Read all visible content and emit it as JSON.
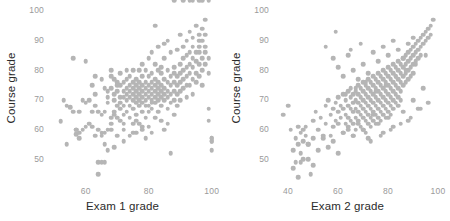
{
  "figure": {
    "background_color": "#ffffff",
    "point_color": "#b5b5b5",
    "tick_color": "#9a9a9a",
    "label_color": "#2b2b2b"
  },
  "chart_data": [
    {
      "type": "scatter",
      "title": "",
      "xlabel": "Exam 1 grade",
      "ylabel": "Course grade",
      "xlim": [
        48,
        102
      ],
      "ylim": [
        43,
        101
      ],
      "xticks": [
        60,
        80,
        100
      ],
      "yticks": [
        50,
        60,
        70,
        80,
        90,
        100
      ],
      "grid": false,
      "legend": "none",
      "x": [
        52,
        53,
        54,
        55,
        56,
        56,
        57,
        57,
        58,
        58,
        58,
        59,
        59,
        60,
        60,
        61,
        61,
        62,
        62,
        62,
        63,
        63,
        63,
        64,
        64,
        64,
        65,
        65,
        65,
        65,
        66,
        66,
        66,
        66,
        67,
        67,
        67,
        67,
        68,
        68,
        68,
        68,
        68,
        69,
        69,
        69,
        69,
        70,
        70,
        70,
        70,
        70,
        71,
        71,
        71,
        71,
        71,
        72,
        72,
        72,
        72,
        72,
        72,
        73,
        73,
        73,
        73,
        73,
        73,
        74,
        74,
        74,
        74,
        74,
        74,
        75,
        75,
        75,
        75,
        75,
        75,
        75,
        76,
        76,
        76,
        76,
        76,
        76,
        76,
        77,
        77,
        77,
        77,
        77,
        77,
        77,
        78,
        78,
        78,
        78,
        78,
        78,
        78,
        78,
        79,
        79,
        79,
        79,
        79,
        79,
        79,
        79,
        80,
        80,
        80,
        80,
        80,
        80,
        80,
        80,
        81,
        81,
        81,
        81,
        81,
        81,
        81,
        81,
        82,
        82,
        82,
        82,
        82,
        82,
        82,
        83,
        83,
        83,
        83,
        83,
        83,
        83,
        84,
        84,
        84,
        84,
        84,
        84,
        85,
        85,
        85,
        85,
        85,
        85,
        86,
        86,
        86,
        86,
        86,
        86,
        87,
        87,
        87,
        87,
        87,
        88,
        88,
        88,
        88,
        88,
        88,
        89,
        89,
        89,
        89,
        89,
        90,
        90,
        90,
        90,
        90,
        90,
        91,
        91,
        91,
        91,
        91,
        92,
        92,
        92,
        92,
        92,
        92,
        93,
        93,
        93,
        93,
        93,
        94,
        94,
        94,
        94,
        94,
        94,
        95,
        95,
        95,
        95,
        95,
        96,
        96,
        96,
        96,
        96,
        96,
        97,
        97,
        97,
        97,
        97,
        98,
        98,
        98,
        98,
        98,
        99,
        99,
        99,
        99,
        100,
        100,
        100,
        100,
        100,
        54,
        57,
        60,
        63,
        66,
        69,
        72,
        75,
        78,
        81,
        84,
        87,
        65,
        68,
        71,
        74,
        86,
        69,
        72,
        76,
        64,
        67,
        70,
        82,
        85,
        88,
        91,
        94,
        97,
        99,
        93,
        96
      ],
      "y": [
        62.8,
        70,
        68,
        67.5,
        66,
        84,
        60,
        58.5,
        59,
        57,
        66,
        60,
        70,
        83,
        69,
        70,
        62,
        66,
        75,
        61,
        68,
        78,
        72,
        49,
        45,
        60,
        65,
        49,
        59,
        77,
        66,
        74,
        59,
        55,
        73,
        69,
        53,
        71,
        80,
        74,
        64,
        60,
        78,
        72,
        66,
        70,
        54,
        76,
        73,
        68,
        64,
        58,
        71,
        75,
        69,
        67,
        79,
        73,
        71,
        76,
        68,
        65,
        62,
        74,
        70,
        77,
        72,
        66,
        80,
        75,
        71,
        73,
        68,
        64,
        78,
        76,
        72,
        70,
        74,
        67,
        80,
        62,
        73,
        71,
        75,
        69,
        77,
        65,
        59,
        76,
        72,
        74,
        70,
        68,
        80,
        62,
        75,
        73,
        71,
        78,
        69,
        66,
        82,
        60,
        74,
        72,
        76,
        70,
        68,
        80,
        64,
        57,
        75,
        73,
        71,
        78,
        68,
        66,
        84,
        61,
        76,
        74,
        72,
        70,
        79,
        67,
        86,
        59,
        75,
        73,
        71,
        77,
        69,
        82,
        64,
        76,
        74,
        72,
        70,
        80,
        66,
        88,
        75,
        73,
        71,
        79,
        68,
        63,
        77,
        74,
        72,
        70,
        84,
        60,
        76,
        73,
        71,
        80,
        67,
        90,
        78,
        75,
        72,
        69,
        86,
        79,
        76,
        73,
        70,
        65,
        81,
        78,
        75,
        72,
        68,
        87,
        82,
        79,
        76,
        73,
        70,
        92,
        84,
        80,
        77,
        74,
        88,
        85,
        81,
        78,
        75,
        71,
        90,
        86,
        82,
        79,
        75,
        93,
        88,
        84,
        81,
        77,
        72,
        91,
        86,
        83,
        79,
        76,
        95,
        90,
        86,
        82,
        78,
        92,
        88,
        84,
        80,
        75,
        94,
        90,
        86,
        82,
        97,
        92,
        88,
        84,
        79,
        63,
        67,
        56,
        57,
        56,
        53,
        57,
        55,
        60,
        61,
        58,
        49,
        77,
        56,
        59,
        61,
        69,
        81,
        52,
        58,
        62,
        63,
        58,
        62,
        65,
        60,
        63,
        66,
        60,
        75,
        95,
        89
      ],
      "n_points": 300
    },
    {
      "type": "scatter",
      "title": "",
      "xlabel": "Exam 2 grade",
      "ylabel": "Course grade",
      "xlim": [
        34,
        102
      ],
      "ylim": [
        43,
        101
      ],
      "xticks": [
        40,
        60,
        80,
        100
      ],
      "yticks": [
        50,
        60,
        70,
        80,
        90,
        100
      ],
      "grid": false,
      "legend": "none",
      "x": [
        38,
        40,
        41,
        42,
        43,
        43,
        44,
        44,
        45,
        45,
        45,
        46,
        46,
        47,
        47,
        48,
        48,
        49,
        50,
        50,
        51,
        52,
        53,
        54,
        55,
        55,
        56,
        57,
        57,
        58,
        58,
        59,
        59,
        60,
        60,
        60,
        61,
        61,
        62,
        62,
        62,
        63,
        63,
        63,
        64,
        64,
        64,
        64,
        65,
        65,
        65,
        65,
        66,
        66,
        66,
        66,
        66,
        67,
        67,
        67,
        67,
        67,
        68,
        68,
        68,
        68,
        68,
        69,
        69,
        69,
        69,
        69,
        70,
        70,
        70,
        70,
        70,
        70,
        71,
        71,
        71,
        71,
        71,
        71,
        72,
        72,
        72,
        72,
        72,
        72,
        73,
        73,
        73,
        73,
        73,
        73,
        74,
        74,
        74,
        74,
        74,
        74,
        75,
        75,
        75,
        75,
        75,
        75,
        76,
        76,
        76,
        76,
        76,
        76,
        77,
        77,
        77,
        77,
        77,
        77,
        78,
        78,
        78,
        78,
        78,
        78,
        79,
        79,
        79,
        79,
        79,
        79,
        80,
        80,
        80,
        80,
        80,
        80,
        81,
        81,
        81,
        81,
        81,
        81,
        82,
        82,
        82,
        82,
        82,
        82,
        83,
        83,
        83,
        83,
        83,
        84,
        84,
        84,
        84,
        84,
        85,
        85,
        85,
        85,
        85,
        86,
        86,
        86,
        86,
        87,
        87,
        87,
        87,
        88,
        88,
        88,
        88,
        89,
        89,
        89,
        89,
        90,
        90,
        90,
        90,
        91,
        91,
        91,
        92,
        92,
        92,
        93,
        93,
        93,
        94,
        94,
        95,
        95,
        96,
        96,
        97,
        97,
        98,
        42,
        44,
        46,
        48,
        50,
        52,
        54,
        56,
        58,
        60,
        62,
        64,
        66,
        68,
        70,
        72,
        74,
        76,
        78,
        80,
        82,
        84,
        86,
        88,
        90,
        92,
        94,
        96,
        58,
        60,
        62,
        64,
        66,
        68,
        70,
        72,
        74,
        76,
        78,
        80,
        82,
        84,
        86,
        88,
        90,
        55,
        59,
        63,
        67,
        71,
        75,
        79,
        83,
        87,
        91,
        95,
        65,
        69,
        73,
        77,
        81,
        85,
        89,
        93
      ],
      "y": [
        65,
        68,
        60,
        53,
        57,
        49,
        61,
        55,
        59,
        52,
        49,
        60,
        56,
        58,
        61,
        55,
        50,
        45,
        57,
        63,
        66,
        60,
        64,
        57,
        68,
        62,
        70,
        58,
        65,
        67,
        61,
        69,
        63,
        71,
        66,
        62,
        68,
        64,
        72,
        67,
        59,
        70,
        65,
        62,
        73,
        68,
        64,
        60,
        71,
        67,
        63,
        74,
        72,
        69,
        66,
        62,
        58,
        73,
        70,
        67,
        64,
        60,
        75,
        72,
        69,
        66,
        62,
        74,
        71,
        68,
        65,
        61,
        76,
        73,
        70,
        67,
        64,
        60,
        75,
        72,
        69,
        66,
        63,
        59,
        77,
        74,
        71,
        68,
        65,
        62,
        76,
        73,
        70,
        67,
        64,
        61,
        78,
        75,
        72,
        69,
        66,
        63,
        77,
        74,
        71,
        68,
        65,
        62,
        79,
        76,
        73,
        70,
        67,
        64,
        78,
        75,
        72,
        69,
        66,
        63,
        80,
        77,
        74,
        71,
        68,
        65,
        79,
        76,
        73,
        70,
        67,
        64,
        81,
        78,
        75,
        72,
        69,
        66,
        80,
        77,
        74,
        71,
        68,
        65,
        82,
        79,
        76,
        73,
        70,
        67,
        81,
        78,
        75,
        72,
        69,
        83,
        80,
        77,
        74,
        71,
        82,
        79,
        76,
        73,
        70,
        84,
        81,
        78,
        75,
        85,
        82,
        79,
        76,
        86,
        83,
        80,
        77,
        87,
        84,
        81,
        78,
        88,
        85,
        82,
        79,
        89,
        86,
        83,
        90,
        87,
        84,
        91,
        88,
        85,
        92,
        89,
        93,
        90,
        94,
        91,
        95,
        92,
        97,
        47,
        44,
        50,
        55,
        48,
        53,
        58,
        54,
        56,
        52,
        59,
        61,
        58,
        63,
        60,
        57,
        65,
        62,
        59,
        64,
        61,
        68,
        66,
        63,
        70,
        67,
        74,
        69,
        84,
        81,
        78,
        85,
        80,
        77,
        82,
        79,
        86,
        83,
        88,
        85,
        90,
        87,
        84,
        89,
        91,
        88,
        93,
        72,
        74,
        76,
        73,
        75,
        78,
        80,
        82,
        85,
        87,
        89,
        56,
        58,
        60,
        62,
        64,
        67,
        69,
        71
      ],
      "n_points": 300
    }
  ]
}
